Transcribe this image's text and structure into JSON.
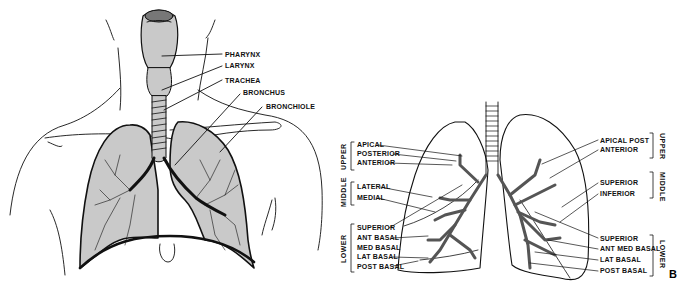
{
  "figure_a": {
    "labels": {
      "pharynx": "PHARYNX",
      "larynx": "LARYNX",
      "trachea": "TRACHEA",
      "bronchus": "BRONCHUS",
      "bronchiole": "BRONCHIOLE"
    }
  },
  "figure_b": {
    "panel_letter": "B",
    "left_lung": {
      "groups": {
        "upper": "UPPER",
        "middle": "MIDDLE",
        "lower": "LOWER"
      },
      "segments": {
        "apical": "APICAL",
        "posterior": "POSTERIOR",
        "anterior": "ANTERIOR",
        "lateral": "LATERAL",
        "medial": "MEDIAL",
        "superior": "SUPERIOR",
        "ant_basal": "ANT BASAL",
        "med_basal": "MED BASAL",
        "lat_basal": "LAT BASAL",
        "post_basal": "POST BASAL"
      }
    },
    "right_lung": {
      "groups": {
        "upper": "UPPER",
        "middle": "MIDDLE",
        "lower": "LOWER"
      },
      "segments": {
        "apical_post": "APICAL POST",
        "anterior": "ANTERIOR",
        "superior_mid": "SUPERIOR",
        "inferior": "INFERIOR",
        "superior_low": "SUPERIOR",
        "ant_med_basal": "ANT MED BASAL",
        "lat_basal": "LAT BASAL",
        "post_basal": "POST BASAL"
      }
    }
  },
  "colors": {
    "lung_fill": "#c9c9c9",
    "line": "#111111",
    "background": "#ffffff"
  }
}
